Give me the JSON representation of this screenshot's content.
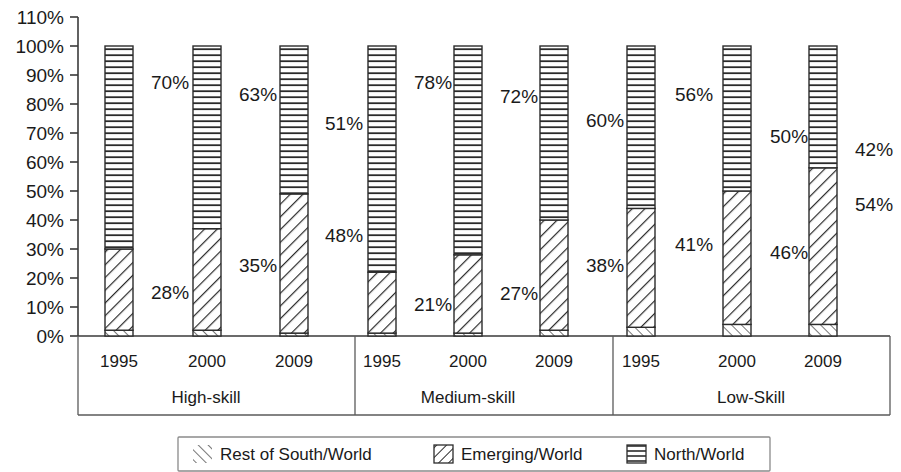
{
  "chart_data": {
    "type": "bar",
    "subtype": "stacked-percentage",
    "title": "",
    "xlabel": "",
    "ylabel": "",
    "ylim": [
      0,
      110
    ],
    "ytick_values": [
      0,
      10,
      20,
      30,
      40,
      50,
      60,
      70,
      80,
      90,
      100,
      110
    ],
    "ytick_labels": [
      "0%",
      "10%",
      "20%",
      "30%",
      "40%",
      "50%",
      "60%",
      "70%",
      "80%",
      "90%",
      "100%",
      "110%"
    ],
    "grid": false,
    "legend_position": "bottom",
    "group_labels": [
      "High-skill",
      "Medium-skill",
      "Low-Skill"
    ],
    "categories": [
      "1995",
      "2000",
      "2009"
    ],
    "series": [
      {
        "name": "Rest of South/World",
        "pattern": "thin-diagonal",
        "values": [
          [
            2,
            2,
            1
          ],
          [
            1,
            1,
            2
          ],
          [
            3,
            4,
            4
          ]
        ]
      },
      {
        "name": "Emerging/World",
        "pattern": "diagonal-hatch",
        "values": [
          [
            28,
            35,
            48
          ],
          [
            21,
            27,
            38
          ],
          [
            41,
            46,
            54
          ]
        ]
      },
      {
        "name": "North/World",
        "pattern": "horizontal-lines",
        "values": [
          [
            70,
            63,
            51
          ],
          [
            78,
            72,
            60
          ],
          [
            56,
            50,
            42
          ]
        ]
      }
    ],
    "data_labels": [
      {
        "text": "70%",
        "x": 151,
        "y": 89
      },
      {
        "text": "28%",
        "x": 151,
        "y": 299
      },
      {
        "text": "63%",
        "x": 239,
        "y": 101
      },
      {
        "text": "35%",
        "x": 239,
        "y": 272
      },
      {
        "text": "51%",
        "x": 325,
        "y": 130
      },
      {
        "text": "48%",
        "x": 325,
        "y": 242
      },
      {
        "text": "78%",
        "x": 414,
        "y": 89
      },
      {
        "text": "21%",
        "x": 414,
        "y": 311
      },
      {
        "text": "72%",
        "x": 500,
        "y": 103
      },
      {
        "text": "27%",
        "x": 500,
        "y": 300
      },
      {
        "text": "60%",
        "x": 586,
        "y": 127
      },
      {
        "text": "38%",
        "x": 586,
        "y": 272
      },
      {
        "text": "56%",
        "x": 675,
        "y": 101
      },
      {
        "text": "41%",
        "x": 675,
        "y": 251
      },
      {
        "text": "50%",
        "x": 770,
        "y": 143
      },
      {
        "text": "46%",
        "x": 770,
        "y": 259
      },
      {
        "text": "42%",
        "x": 855,
        "y": 156
      },
      {
        "text": "54%",
        "x": 855,
        "y": 211
      }
    ]
  },
  "legend": {
    "items": [
      {
        "label": "Rest of South/World",
        "swatch": "thin-diagonal-swatch"
      },
      {
        "label": "Emerging/World",
        "swatch": "diagonal-hatch-swatch"
      },
      {
        "label": "North/World",
        "swatch": "horizontal-lines-swatch"
      }
    ]
  },
  "axis": {
    "y_ticks": [
      {
        "label": "110%",
        "value": 110
      },
      {
        "label": "100%",
        "value": 100
      },
      {
        "label": "90%",
        "value": 90
      },
      {
        "label": "80%",
        "value": 80
      },
      {
        "label": "70%",
        "value": 70
      },
      {
        "label": "60%",
        "value": 60
      },
      {
        "label": "50%",
        "value": 50
      },
      {
        "label": "40%",
        "value": 40
      },
      {
        "label": "30%",
        "value": 30
      },
      {
        "label": "20%",
        "value": 20
      },
      {
        "label": "10%",
        "value": 10
      },
      {
        "label": "0%",
        "value": 0
      }
    ],
    "x_categories": [
      {
        "label": "1995"
      },
      {
        "label": "2000"
      },
      {
        "label": "2009"
      },
      {
        "label": "1995"
      },
      {
        "label": "2000"
      },
      {
        "label": "2009"
      },
      {
        "label": "1995"
      },
      {
        "label": "2000"
      },
      {
        "label": "2009"
      }
    ],
    "x_groups": [
      {
        "label": "High-skill"
      },
      {
        "label": "Medium-skill"
      },
      {
        "label": "Low-Skill"
      }
    ]
  },
  "colors": {
    "ink": "#1a1a1a",
    "line": "#3a3a3a",
    "bar_stroke": "#2b2b2b",
    "background": "#ffffff"
  }
}
